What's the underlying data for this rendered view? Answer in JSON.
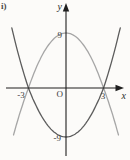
{
  "figure": {
    "index_label": "i)"
  },
  "chart_data": {
    "type": "line",
    "axes": {
      "x_label": "x",
      "y_label": "y",
      "origin_label": "O",
      "x_tick_labels": [
        "-3",
        "3"
      ],
      "y_tick_labels": [
        "9",
        "-9"
      ],
      "x_ticks": [
        -3,
        3
      ],
      "y_ticks": [
        9,
        -9
      ],
      "grid": false
    },
    "curves": [
      {
        "name": "downward-parabola",
        "direction": "down",
        "vertex": [
          0,
          9
        ],
        "x_intercepts": [
          -3,
          3
        ],
        "x_draw_limit": 4.2,
        "color": "#a6a6a6"
      },
      {
        "name": "upward-parabola",
        "direction": "up",
        "vertex": [
          0,
          -9
        ],
        "x_intercepts": [
          -3,
          3
        ],
        "x_draw_limit": 4.34,
        "color": "#5c5c5c"
      }
    ],
    "axis_color": "#1f1f1f"
  }
}
